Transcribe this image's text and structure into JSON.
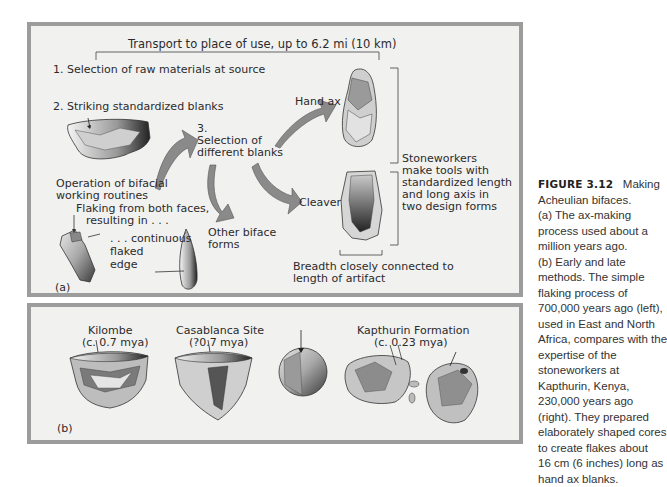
{
  "figure": {
    "number": "FIGURE 3.12",
    "title": "Making",
    "caption_lines": [
      "Acheulian bifaces.",
      "(a) The ax-making",
      "process used about a",
      "million years ago.",
      "(b) Early and late",
      "methods. The simple",
      "flaking process of",
      "700,000 years ago (left),",
      "used in East and North",
      "Africa, compares with the",
      "expertise of the",
      "stoneworkers at",
      "Kapthurin, Kenya,",
      "230,000 years ago",
      "(right). They prepared",
      "elaborately shaped cores",
      "to create flakes about",
      "16 cm (6 inches) long as",
      "hand ax blanks."
    ]
  },
  "panel_a": {
    "label": "(a)",
    "transport": "Transport to place of use, up to 6.2 mi (10 km)",
    "step1": "1. Selection of raw materials at source",
    "step2": "2. Striking standardized blanks",
    "step3_num": "3.",
    "step3_l1": "Selection of",
    "step3_l2": "different blanks",
    "bifacial_l1": "Operation of bifacial",
    "bifacial_l2": "working routines",
    "flaking_l1": "Flaking from both faces,",
    "flaking_l2": "resulting in . . .",
    "continuous_l1": ". . . continuous",
    "continuous_l2": "flaked",
    "continuous_l3": "edge",
    "other_l1": "Other biface",
    "other_l2": "forms",
    "hand_ax": "Hand ax",
    "cleaver": "Cleaver",
    "stoneworkers_lines": [
      "Stoneworkers",
      "make tools with",
      "standardized length",
      "and long axis in",
      "two design forms"
    ],
    "breadth_l1": "Breadth closely connected to",
    "breadth_l2": "length of artifact"
  },
  "panel_b": {
    "label": "(b)",
    "sites": [
      {
        "name": "Kilombe",
        "date": "(c. 0.7 mya)"
      },
      {
        "name": "Casablanca Site",
        "date": "(?0.7 mya)"
      },
      {
        "name": "Kapthurin Formation",
        "date": "(c. 0.23 mya)"
      }
    ]
  },
  "colors": {
    "panel_bg": "#f1f1f0",
    "panel_border": "#9c9c9c",
    "arrow_fill": "#8a8a8a",
    "text": "#2b2b2b"
  }
}
